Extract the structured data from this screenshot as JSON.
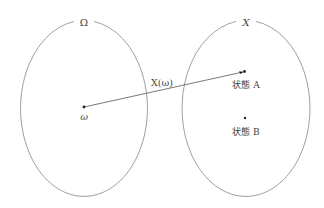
{
  "diagram": {
    "left_set": {
      "label": "Ω",
      "point_label": "ω"
    },
    "right_set": {
      "label": "X",
      "points": [
        {
          "label": "状態 A"
        },
        {
          "label": "状態 B"
        }
      ]
    },
    "mapping": {
      "label": "X(ω)"
    },
    "colors": {
      "stroke": "#888888",
      "line": "#555555",
      "point": "#222222",
      "text": "#444444"
    }
  }
}
